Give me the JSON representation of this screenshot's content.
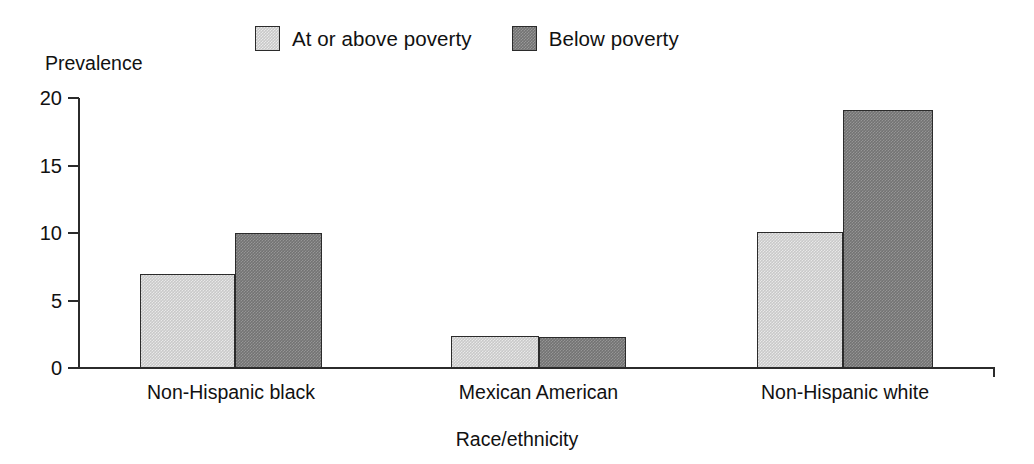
{
  "chart_data": {
    "type": "bar",
    "title": "",
    "xlabel": "Race/ethnicity",
    "ylabel": "Prevalence",
    "categories": [
      "Non-Hispanic black",
      "Mexican American",
      "Non-Hispanic white"
    ],
    "series": [
      {
        "name": "At or above poverty",
        "color": "#c9c9c9",
        "values": [
          7.0,
          2.4,
          10.1
        ]
      },
      {
        "name": "Below poverty",
        "color": "#737373",
        "values": [
          10.0,
          2.3,
          19.1
        ]
      }
    ],
    "ylim": [
      0,
      20
    ],
    "yticks": [
      0,
      5,
      10,
      15,
      20
    ],
    "ytick_labels": [
      "0",
      "5",
      "10",
      "15",
      "20"
    ],
    "grid": false,
    "legend_position": "top-center"
  },
  "legend": {
    "entries": [
      {
        "label": "At or above poverty",
        "swatch": "light-gray-square"
      },
      {
        "label": "Below poverty",
        "swatch": "dark-gray-square"
      }
    ]
  },
  "axes": {
    "y_title": "Prevalence",
    "x_title": "Race/ethnicity",
    "y_ticks": [
      "20",
      "15",
      "10",
      "5",
      "0"
    ]
  }
}
